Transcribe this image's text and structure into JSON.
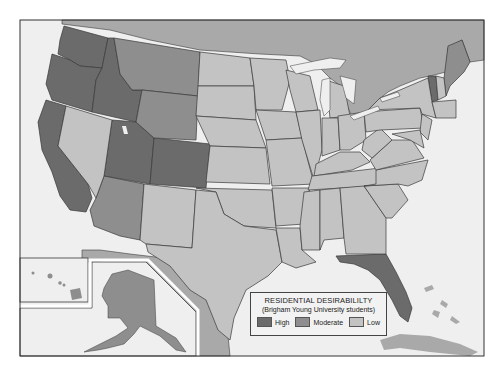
{
  "legend": {
    "title": "RESIDENTIAL DESIRABILILTY",
    "subtitle": "(Brigham Young University students)",
    "items": [
      {
        "label": "High",
        "color": "#6b6b6b"
      },
      {
        "label": "Moderate",
        "color": "#8e8e8e"
      },
      {
        "label": "Low",
        "color": "#c3c3c3"
      }
    ]
  },
  "colors": {
    "high": "#6b6b6b",
    "moderate": "#8e8e8e",
    "low": "#c3c3c3",
    "foreign": "#a9a9a9",
    "water": "#efefef",
    "border": "#3a3a3a"
  },
  "states": {
    "high": [
      "Washington",
      "Oregon",
      "California",
      "Idaho",
      "Utah",
      "Colorado",
      "Florida",
      "Vermont"
    ],
    "moderate": [
      "Montana",
      "Wyoming",
      "Arizona",
      "Alaska",
      "Hawaii",
      "Maine"
    ],
    "low": [
      "Nevada",
      "New Mexico",
      "North Dakota",
      "South Dakota",
      "Nebraska",
      "Kansas",
      "Oklahoma",
      "Texas",
      "Minnesota",
      "Iowa",
      "Missouri",
      "Arkansas",
      "Louisiana",
      "Wisconsin",
      "Illinois",
      "Michigan",
      "Indiana",
      "Ohio",
      "Kentucky",
      "Tennessee",
      "Mississippi",
      "Alabama",
      "Georgia",
      "South Carolina",
      "North Carolina",
      "Virginia",
      "West Virginia",
      "Pennsylvania",
      "New York",
      "New Jersey",
      "Maryland",
      "Delaware",
      "Connecticut",
      "Rhode Island",
      "Massachusetts",
      "New Hampshire"
    ]
  }
}
